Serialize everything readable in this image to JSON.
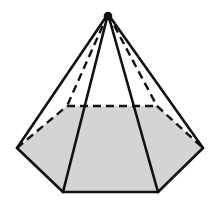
{
  "figure": {
    "type": "hexagonal-pyramid",
    "colors": {
      "stroke": "#111111",
      "base_fill": "#d4d4d4",
      "background": "#ffffff"
    },
    "vertices": {
      "apex": [
        108,
        14
      ],
      "left": [
        17,
        148
      ],
      "back_left": [
        67,
        106
      ],
      "back_right": [
        157,
        106
      ],
      "right": [
        203,
        148
      ],
      "front_right": [
        158,
        192
      ],
      "front_left": [
        63,
        192
      ]
    },
    "solid_edges": [
      [
        "apex",
        "left"
      ],
      [
        "apex",
        "right"
      ],
      [
        "apex",
        "front_left"
      ],
      [
        "apex",
        "front_right"
      ],
      [
        "left",
        "front_left"
      ],
      [
        "front_left",
        "front_right"
      ],
      [
        "front_right",
        "right"
      ]
    ],
    "hidden_edges": [
      [
        "apex",
        "back_left"
      ],
      [
        "apex",
        "back_right"
      ],
      [
        "left",
        "back_left"
      ],
      [
        "back_left",
        "back_right"
      ],
      [
        "back_right",
        "right"
      ]
    ]
  }
}
